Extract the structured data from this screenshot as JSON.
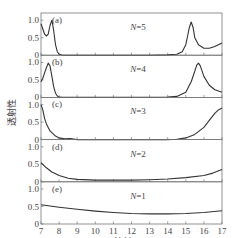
{
  "chart_data": {
    "type": "line",
    "title": "",
    "xlabel": "波长/μm",
    "ylabel": "透射性",
    "xlim": [
      7,
      17
    ],
    "x_ticks": [
      "7",
      "8",
      "9",
      "10",
      "11",
      "12",
      "13",
      "14",
      "15",
      "16",
      "17"
    ],
    "y_ticks": [
      "0",
      "0.5",
      "1.0"
    ],
    "ylim": [
      0,
      1.15
    ],
    "panels": [
      {
        "tag": "(a)",
        "label": "N=5",
        "x": [
          7,
          7.1,
          7.2,
          7.3,
          7.4,
          7.5,
          7.6,
          7.7,
          7.8,
          7.9,
          8.0,
          8.2,
          8.5,
          9,
          10,
          11,
          12,
          13,
          14,
          14.5,
          14.8,
          15.0,
          15.1,
          15.2,
          15.3,
          15.4,
          15.5,
          15.7,
          16,
          16.3,
          16.6,
          17
        ],
        "y": [
          0.9,
          0.75,
          0.6,
          0.55,
          0.6,
          0.85,
          1.0,
          0.7,
          0.3,
          0.1,
          0.03,
          0.0,
          0.0,
          0.0,
          0.0,
          0.0,
          0.0,
          0.0,
          0.01,
          0.03,
          0.1,
          0.3,
          0.55,
          0.8,
          0.95,
          0.8,
          0.5,
          0.3,
          0.2,
          0.2,
          0.25,
          0.35
        ]
      },
      {
        "tag": "(b)",
        "label": "N=4",
        "x": [
          7,
          7.1,
          7.2,
          7.3,
          7.4,
          7.5,
          7.6,
          7.7,
          7.8,
          7.9,
          8.0,
          8.2,
          8.5,
          9,
          10,
          11,
          12,
          13,
          14,
          14.5,
          15,
          15.3,
          15.5,
          15.6,
          15.7,
          15.8,
          16,
          16.3,
          16.6,
          17
        ],
        "y": [
          0.45,
          0.55,
          0.7,
          0.85,
          0.98,
          0.9,
          0.6,
          0.3,
          0.12,
          0.04,
          0.01,
          0.0,
          0.0,
          0.0,
          0.0,
          0.0,
          0.0,
          0.0,
          0.01,
          0.03,
          0.15,
          0.45,
          0.75,
          0.92,
          0.98,
          0.9,
          0.6,
          0.35,
          0.22,
          0.15
        ]
      },
      {
        "tag": "(c)",
        "label": "N=3",
        "x": [
          7,
          7.1,
          7.2,
          7.3,
          7.5,
          7.8,
          8.0,
          8.3,
          8.6,
          9,
          10,
          11,
          12,
          13,
          14,
          14.5,
          15,
          15.5,
          16,
          16.3,
          16.6,
          16.8,
          17
        ],
        "y": [
          1.0,
          0.85,
          0.6,
          0.45,
          0.25,
          0.1,
          0.05,
          0.02,
          0.03,
          0.0,
          0.0,
          0.0,
          0.0,
          0.0,
          0.0,
          0.01,
          0.05,
          0.15,
          0.35,
          0.55,
          0.75,
          0.85,
          0.9
        ]
      },
      {
        "tag": "(d)",
        "label": "N=2",
        "x": [
          7,
          7.3,
          7.6,
          8.0,
          8.5,
          9,
          10,
          11,
          12,
          13,
          14,
          15,
          16,
          16.5,
          17
        ],
        "y": [
          0.55,
          0.4,
          0.28,
          0.18,
          0.1,
          0.07,
          0.05,
          0.05,
          0.05,
          0.06,
          0.08,
          0.12,
          0.18,
          0.25,
          0.35
        ]
      },
      {
        "tag": "(e)",
        "label": "N=1",
        "x": [
          7,
          8,
          9,
          10,
          11,
          12,
          13,
          14,
          15,
          16,
          17
        ],
        "y": [
          0.55,
          0.48,
          0.42,
          0.37,
          0.33,
          0.3,
          0.29,
          0.29,
          0.3,
          0.33,
          0.38
        ]
      }
    ],
    "grid": false,
    "legend": "inline panel labels"
  }
}
